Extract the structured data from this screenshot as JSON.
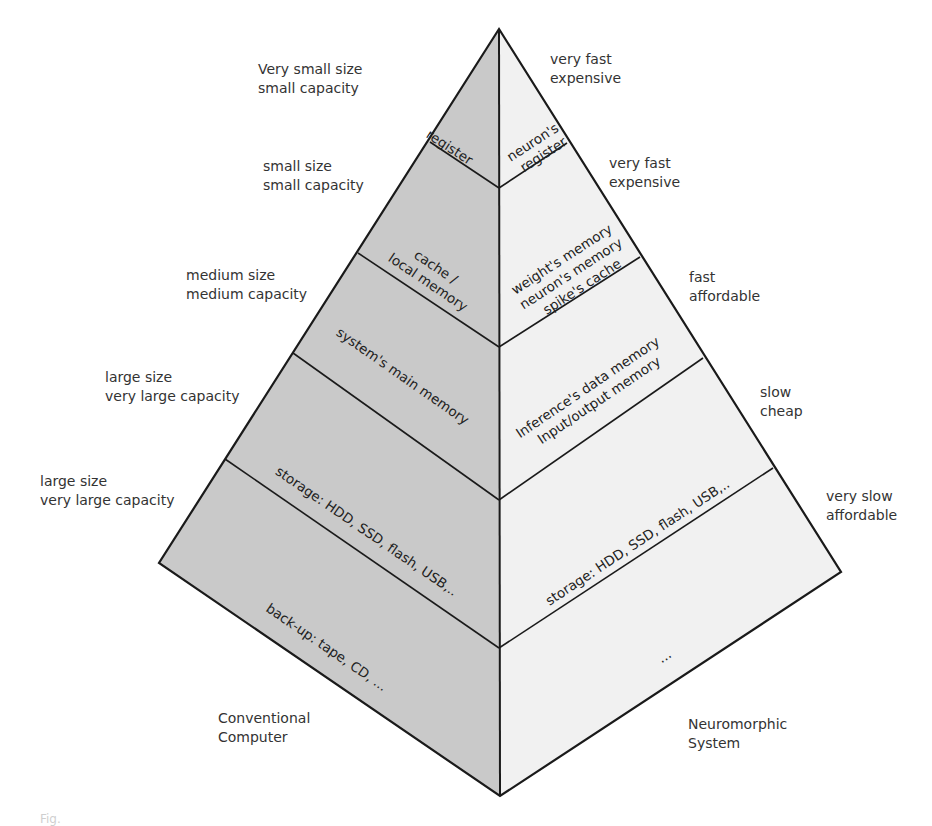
{
  "colors": {
    "left_face": "#c9c9c9",
    "right_face": "#f1f1f1",
    "stroke": "#1a1a1a",
    "text": "#2b2b2b"
  },
  "pyramid": {
    "left_title_line1": "Conventional",
    "left_title_line2": "Computer",
    "right_title_line1": "Neuromorphic",
    "right_title_line2": "System"
  },
  "left_tiers": [
    {
      "label_lines": [
        "register"
      ]
    },
    {
      "label_lines": [
        "cache /",
        "local memory"
      ]
    },
    {
      "label_lines": [
        "system's main memory"
      ]
    },
    {
      "label_lines": [
        "storage: HDD, SSD, flash, USB,.."
      ]
    },
    {
      "label_lines": [
        "back-up: tape, CD, ..."
      ]
    }
  ],
  "right_tiers": [
    {
      "label_lines": [
        "neuron's",
        "register"
      ]
    },
    {
      "label_lines": [
        "weight's memory",
        "neuron's memory",
        "spike's cache"
      ]
    },
    {
      "label_lines": [
        "Inference's data memory",
        "Input/output memory"
      ]
    },
    {
      "label_lines": [
        "storage: HDD, SSD, flash, USB,.."
      ]
    },
    {
      "label_lines": [
        "..."
      ]
    }
  ],
  "left_annotations": [
    {
      "line1": "Very small size",
      "line2": "small capacity"
    },
    {
      "line1": "small size",
      "line2": "small capacity"
    },
    {
      "line1": "medium size",
      "line2": "medium capacity"
    },
    {
      "line1": "large size",
      "line2": "very large capacity"
    },
    {
      "line1": "large size",
      "line2": "very large capacity"
    }
  ],
  "right_annotations": [
    {
      "line1": "very fast",
      "line2": "expensive"
    },
    {
      "line1": "very fast",
      "line2": "expensive"
    },
    {
      "line1": "fast",
      "line2": "affordable"
    },
    {
      "line1": "slow",
      "line2": "cheap"
    },
    {
      "line1": "very slow",
      "line2": "affordable"
    }
  ],
  "caption": "Fig."
}
